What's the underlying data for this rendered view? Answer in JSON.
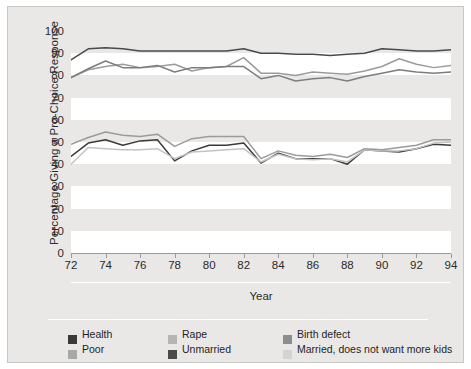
{
  "chart_data": {
    "type": "line",
    "title": "",
    "xlabel": "Year",
    "ylabel": "Percentage Giving a Pro-Choice Response",
    "xlim": [
      72,
      94
    ],
    "ylim": [
      0,
      100
    ],
    "grid": "horizontal-bands",
    "legend_position": "bottom-left",
    "x": [
      72,
      73,
      74,
      75,
      76,
      77,
      78,
      79,
      80,
      81,
      82,
      83,
      84,
      85,
      86,
      87,
      88,
      89,
      90,
      91,
      92,
      93,
      94
    ],
    "xticklabels": [
      "72",
      "74",
      "76",
      "78",
      "80",
      "82",
      "84",
      "86",
      "88",
      "90",
      "92",
      "94"
    ],
    "yticklabels": [
      "0",
      "10",
      "20",
      "30",
      "40",
      "50",
      "60",
      "70",
      "80",
      "90",
      "100"
    ],
    "series": [
      {
        "name": "Health",
        "color": "#4a4a4a",
        "values": [
          87,
          92,
          92.5,
          92,
          91,
          91,
          91,
          91,
          91,
          91,
          92,
          90,
          90,
          89.5,
          89.5,
          89,
          89.5,
          90,
          92,
          91.5,
          91,
          91,
          91.5
        ]
      },
      {
        "name": "Rape",
        "color": "#9b9b9b",
        "values": [
          79,
          82.5,
          84,
          85,
          83.5,
          84,
          85,
          82,
          83.5,
          84,
          88,
          81,
          81,
          80,
          81.5,
          81,
          80.5,
          82,
          84,
          87.5,
          85,
          83.5,
          84.5
        ]
      },
      {
        "name": "Birth defect",
        "color": "#7d7d7d",
        "values": [
          79,
          83,
          86.5,
          83.5,
          83.5,
          84.5,
          81.5,
          83.5,
          83.5,
          84,
          84,
          78.5,
          80,
          77.5,
          78.5,
          79,
          77.5,
          79.5,
          81,
          82.5,
          81.5,
          81,
          81.5
        ]
      },
      {
        "name": "Poor",
        "color": "#9b9b9b",
        "values": [
          49,
          52,
          54.5,
          53,
          52.5,
          53.5,
          48,
          51.5,
          52.5,
          52.5,
          52.5,
          42.5,
          46,
          44,
          43.5,
          44.5,
          43,
          47,
          46.5,
          47.5,
          48.5,
          51,
          51
        ]
      },
      {
        "name": "Unmarried",
        "color": "#3a3a3a",
        "values": [
          43.5,
          49.5,
          51,
          48.5,
          50.5,
          51,
          41.5,
          46,
          48.5,
          48.5,
          49.5,
          40.5,
          45,
          42.5,
          42.5,
          42.5,
          40,
          46.5,
          46,
          45.5,
          47,
          49,
          48.5
        ]
      },
      {
        "name": "Married, does not want more kids",
        "color": "#c3c3c3",
        "values": [
          40,
          47.5,
          47,
          46.5,
          46.5,
          47,
          42.5,
          45.5,
          46,
          46.5,
          47,
          41,
          44.5,
          42.5,
          42,
          42.5,
          41,
          46.5,
          46,
          46,
          47,
          49.5,
          50
        ]
      }
    ]
  },
  "legend": {
    "rows": [
      [
        {
          "label": "Health",
          "color": "#3a3a3a"
        },
        {
          "label": "Rape",
          "color": "#b5b5b5"
        },
        {
          "label": "Birth defect",
          "color": "#8d8d8d"
        }
      ],
      [
        {
          "label": "Poor",
          "color": "#a8a8a8"
        },
        {
          "label": "Unmarried",
          "color": "#4a4a4a"
        },
        {
          "label": "Married, does not want more kids",
          "color": "#d3d3d3"
        }
      ]
    ]
  }
}
